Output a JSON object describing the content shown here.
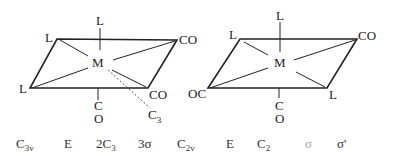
{
  "diagrams": [
    {
      "name": "fac-isomer",
      "center": "M",
      "axial_top": "L",
      "axial_bottom": [
        "C",
        "O"
      ],
      "corners": {
        "top_left": "L",
        "top_right": "CO",
        "bottom_left": "L",
        "bottom_right": "CO"
      },
      "axis_label": {
        "main": "C",
        "sub": "3"
      }
    },
    {
      "name": "mer-isomer",
      "center": "M",
      "axial_top": "L",
      "axial_bottom": [
        "C",
        "O"
      ],
      "corners": {
        "top_left": "L",
        "top_right": "CO",
        "bottom_left": "OC",
        "bottom_right": "L"
      }
    }
  ],
  "symmetry_row": [
    {
      "main": "C",
      "sub": "3v"
    },
    {
      "main": "E",
      "sub": ""
    },
    {
      "main": "2C",
      "sub": "3"
    },
    {
      "main": "3σ",
      "sub": ""
    },
    {
      "main": "C",
      "sub": "2v"
    },
    {
      "main": "E",
      "sub": ""
    },
    {
      "main": "C",
      "sub": "2"
    },
    {
      "main": "σ",
      "sub": ""
    },
    {
      "main": "σ'",
      "sub": ""
    }
  ]
}
